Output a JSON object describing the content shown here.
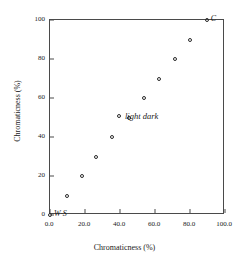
{
  "chart_data": {
    "type": "scatter",
    "title": "",
    "xlabel": "Chromaticness (%)",
    "ylabel": "Chromaticness (%)",
    "xlim": [
      0,
      100
    ],
    "ylim": [
      0,
      100
    ],
    "grid": false,
    "legend_position": "inside-center",
    "xticks": [
      "0.0",
      "20.0",
      "40.0",
      "60.0",
      "80.0",
      "100.0"
    ],
    "xtick_values": [
      0,
      20,
      40,
      60,
      80,
      100
    ],
    "yticks": [
      "0",
      "20",
      "40",
      "60",
      "80",
      "100"
    ],
    "ytick_values": [
      0,
      20,
      40,
      60,
      80,
      100
    ],
    "series": [
      {
        "name": "light dark",
        "marker": "open-circle",
        "color": "#2b2b2b",
        "x": [
          0,
          9.5,
          18,
          26.5,
          35.5,
          45,
          53.5,
          62.5,
          71.5,
          80,
          89.5
        ],
        "y": [
          0,
          10,
          20,
          30,
          40,
          50,
          60,
          70,
          80,
          90,
          100
        ]
      }
    ],
    "annotations": [
      {
        "label": "W·S",
        "x": 0,
        "y": 0,
        "anchor": "right"
      },
      {
        "label": "C",
        "x": 89.5,
        "y": 100,
        "anchor": "right"
      }
    ]
  },
  "legend": {
    "marker_name": "open-circle-marker",
    "label": "light dark"
  }
}
